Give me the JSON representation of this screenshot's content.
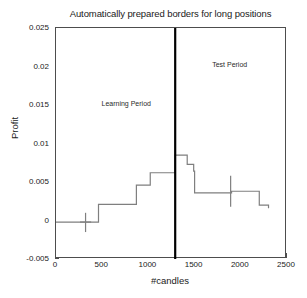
{
  "chart_data": {
    "type": "line",
    "title": "Automatically prepared borders for long positions",
    "xlabel": "#candles",
    "ylabel": "Profit",
    "xlim": [
      0,
      2500
    ],
    "ylim": [
      -0.005,
      0.025
    ],
    "xticks": [
      0,
      500,
      1000,
      1500,
      2000,
      2500
    ],
    "xticklabels": [
      "0",
      "500",
      "1000",
      "1500",
      "2000",
      "2500"
    ],
    "yticks": [
      -0.005,
      0,
      0.005,
      0.01,
      0.015,
      0.02,
      0.025
    ],
    "yticklabels": [
      "-0.005",
      "0",
      "0.005",
      "0.01",
      "0.015",
      "0.02",
      "0.025"
    ],
    "grid": false,
    "legend": null,
    "drawstyle": "steps-post",
    "line_color": "#7f7f7f",
    "line_width": 1.2,
    "series": [
      {
        "name": "Profit border",
        "x": [
          0,
          320,
          450,
          460,
          620,
          750,
          870,
          930,
          1020,
          1290,
          1300,
          1420,
          1430,
          1490,
          1500,
          1850,
          1900,
          2130,
          2140,
          2200,
          2300
        ],
        "values": [
          -0.0002,
          -0.0002,
          -0.0002,
          0.0021,
          0.0021,
          0.0021,
          0.0046,
          0.0046,
          0.0062,
          0.0085,
          0.0085,
          0.0073,
          0.0073,
          0.0064,
          0.0036,
          0.0036,
          0.0038,
          0.0038,
          0.0038,
          0.002,
          0.0016
        ]
      }
    ],
    "errorbars": [
      {
        "x": 320,
        "y": -0.0002,
        "lower": -0.0015,
        "upper": 0.001,
        "cap_half_width": 60
      },
      {
        "x": 1890,
        "y": 0.0038,
        "lower": 0.0018,
        "upper": 0.0058,
        "cap_half_width": 0
      }
    ],
    "vline": {
      "x": 1290,
      "color": "#000000",
      "width": 2.2,
      "label": "period-split"
    },
    "annotations": [
      {
        "text": "Learning Period",
        "x": 760,
        "y": 0.0152
      },
      {
        "text": "Test Period",
        "x": 1880,
        "y": 0.0203
      }
    ]
  },
  "figure": {
    "background": "#ffffff",
    "axes_color": "#4d4d4d",
    "text_color": "#1a1a1a"
  }
}
